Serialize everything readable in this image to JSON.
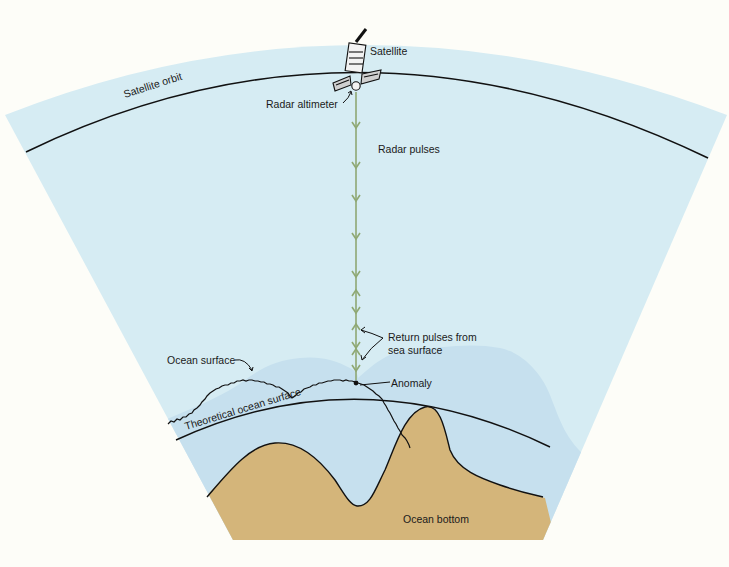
{
  "diagram": {
    "colors": {
      "background": "#fdfdf8",
      "sky": "#d6ecf3",
      "water": "#c6e0ee",
      "seafloor": "#d4b57a",
      "line": "#111111",
      "pulse": "#8fa873"
    },
    "labels": {
      "satellite": "Satellite",
      "satellite_orbit": "Satellite orbit",
      "radar_altimeter": "Radar altimeter",
      "radar_pulses": "Radar pulses",
      "return_pulses_line1": "Return pulses from",
      "return_pulses_line2": "sea surface",
      "ocean_surface": "Ocean surface",
      "anomaly": "Anomaly",
      "theoretical_ocean_surface": "Theoretical ocean surface",
      "ocean_bottom": "Ocean bottom"
    },
    "nodes": [
      {
        "id": "satellite",
        "label": "Satellite"
      },
      {
        "id": "radar-altimeter",
        "label": "Radar altimeter"
      },
      {
        "id": "satellite-orbit",
        "label": "Satellite orbit"
      },
      {
        "id": "radar-pulses",
        "label": "Radar pulses"
      },
      {
        "id": "return-pulses",
        "label": "Return pulses from sea surface"
      },
      {
        "id": "ocean-surface",
        "label": "Ocean surface"
      },
      {
        "id": "anomaly",
        "label": "Anomaly"
      },
      {
        "id": "theoretical-ocean-surface",
        "label": "Theoretical ocean surface"
      },
      {
        "id": "ocean-bottom",
        "label": "Ocean bottom"
      }
    ],
    "edges": [
      {
        "from": "radar-altimeter",
        "to": "ocean-surface",
        "label": "Radar pulses",
        "direction": "down"
      },
      {
        "from": "ocean-surface",
        "to": "radar-altimeter",
        "label": "Return pulses from sea surface",
        "direction": "up"
      }
    ]
  }
}
